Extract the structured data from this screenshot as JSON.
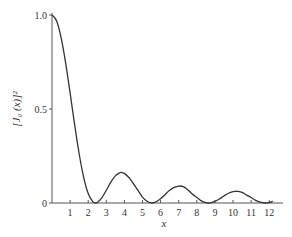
{
  "chart_data": {
    "type": "line",
    "title": "",
    "xlabel": "x",
    "ylabel": "[J₀ (x)]²",
    "xlim": [
      0,
      12.7
    ],
    "ylim": [
      0,
      1.0
    ],
    "grid": false,
    "legend": null,
    "x_ticks": [
      1,
      2,
      3,
      4,
      5,
      6,
      7,
      8,
      9,
      10,
      11,
      12
    ],
    "x_tick_labels": [
      "1",
      "2",
      "3",
      "4",
      "5",
      "6",
      "7",
      "8",
      "9",
      "10",
      "11",
      "12"
    ],
    "y_ticks": [
      0,
      0.5,
      1.0
    ],
    "y_tick_labels": [
      "0",
      "0.5",
      "1.0"
    ],
    "line_color": "#333333",
    "series": [
      {
        "name": "[J0(x)]^2",
        "x": [
          0,
          0.25,
          0.5,
          0.75,
          1.0,
          1.25,
          1.5,
          1.75,
          2.0,
          2.25,
          2.4,
          2.5,
          2.75,
          3.0,
          3.25,
          3.5,
          3.75,
          3.83,
          4.0,
          4.25,
          4.5,
          4.75,
          5.0,
          5.25,
          5.52,
          5.75,
          6.0,
          6.25,
          6.5,
          6.75,
          7.0,
          7.25,
          7.5,
          7.75,
          8.0,
          8.25,
          8.5,
          8.65,
          8.75,
          9.0,
          9.25,
          9.5,
          9.75,
          10.0,
          10.17,
          10.25,
          10.5,
          10.75,
          11.0,
          11.25,
          11.5,
          11.79,
          12.0,
          12.2
        ],
        "values": [
          1.0,
          0.9691,
          0.8808,
          0.7468,
          0.5855,
          0.4172,
          0.2619,
          0.1362,
          0.0501,
          0.0068,
          0.0,
          0.0023,
          0.0269,
          0.0677,
          0.1108,
          0.1445,
          0.1611,
          0.1622,
          0.1577,
          0.1354,
          0.1027,
          0.0671,
          0.0315,
          0.0093,
          0.0,
          0.0065,
          0.0227,
          0.0456,
          0.0677,
          0.0827,
          0.0901,
          0.0871,
          0.0709,
          0.0482,
          0.0295,
          0.0113,
          0.0018,
          0.0,
          0.0007,
          0.0082,
          0.0214,
          0.0376,
          0.052,
          0.0605,
          0.0622,
          0.062,
          0.056,
          0.042,
          0.0293,
          0.0142,
          0.0046,
          0.0,
          0.0023,
          0.0086
        ]
      }
    ]
  }
}
